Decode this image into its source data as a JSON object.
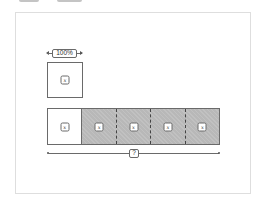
{
  "diagram": {
    "type": "tape-diagram",
    "unit_block": {
      "width_label": "100%",
      "variable": "x"
    },
    "bar": {
      "segments": [
        {
          "variable": "x",
          "shaded": false
        },
        {
          "variable": "x",
          "shaded": true
        },
        {
          "variable": "x",
          "shaded": true
        },
        {
          "variable": "x",
          "shaded": true
        },
        {
          "variable": "x",
          "shaded": true
        }
      ],
      "total_label": "?"
    },
    "colors": {
      "outline": "#6a6a6a",
      "shaded_fill": "#b8b8b8",
      "frame_border": "#dedede",
      "background": "#ffffff"
    }
  }
}
